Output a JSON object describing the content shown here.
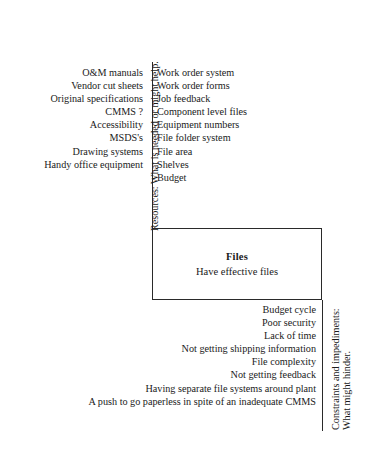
{
  "diagram": {
    "type": "force-field-analysis",
    "center": {
      "title": "Files",
      "subtitle": "Have effective files"
    },
    "resources": {
      "axis_label": "Resources:  What is needed or might help.",
      "general_items": [
        "O&M manuals",
        "Vendor cut sheets",
        "Original specifications",
        "CMMS ?",
        "Accessibility",
        "MSDS's",
        "Drawing systems",
        "Handy office equipment"
      ],
      "detail_items": [
        "Work order system",
        "Work order forms",
        "Job feedback",
        "Component level files",
        "Equipment numbers",
        "File folder system",
        "File area",
        "Shelves",
        "Budget"
      ]
    },
    "constraints": {
      "axis_label_line1": "Constraints and impediments:",
      "axis_label_line2": "What might hinder.",
      "items": [
        "Budget cycle",
        "Poor security",
        "Lack of time",
        "Not getting shipping information",
        "File complexity",
        "Not getting feedback",
        "Having separate file systems around plant",
        "A push to go paperless in spite of an inadequate CMMS"
      ]
    },
    "caption": "",
    "colors": {
      "stroke": "#2a2a2a",
      "text": "#1a1a1a",
      "background": "#ffffff"
    }
  }
}
